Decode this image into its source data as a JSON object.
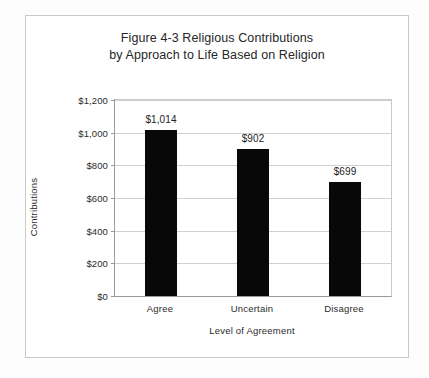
{
  "figure": {
    "background_color": "#fdfdfd",
    "frame_color": "#c9c9c9",
    "title_line_1": "Figure 4-3 Religious Contributions",
    "title_line_2": "by Approach to Life Based on Religion"
  },
  "chart_data": {
    "type": "bar",
    "title": "Figure 4-3 Religious Contributions by Approach to Life Based on Religion",
    "categories": [
      "Agree",
      "Uncertain",
      "Disagree"
    ],
    "values": [
      1014,
      902,
      699
    ],
    "data_labels": [
      "$1,014",
      "$902",
      "$699"
    ],
    "xlabel": "Level of Agreement",
    "ylabel": "Contributions",
    "ylim": [
      0,
      1200
    ],
    "ytick_values": [
      0,
      200,
      400,
      600,
      800,
      1000,
      1200
    ],
    "ytick_labels": [
      "$0",
      "$200",
      "$400",
      "$600",
      "$800",
      "$1,000",
      "$1,200"
    ],
    "grid": "horizontal",
    "legend": "none",
    "bar_color": "#080808",
    "gridline_color": "#cfcfcf",
    "axis_color": "#9a9a9a"
  }
}
